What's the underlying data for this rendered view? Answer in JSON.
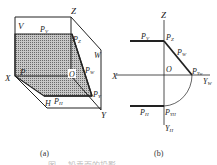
{
  "figure": {
    "panel_a": {
      "caption": "(a)",
      "labels": {
        "V": "V",
        "Z": "Z",
        "W": "W",
        "X": "X",
        "Y": "Y",
        "H": "H",
        "O": "O",
        "P": "P",
        "PV": "P",
        "PV_sub": "V",
        "PZ": "P",
        "PZ_sub": "Z",
        "PW": "P",
        "PW_sub": "W",
        "PH": "P",
        "PH_sub": "H",
        "PY": "P",
        "PY_sub": "Y"
      }
    },
    "panel_b": {
      "caption": "(b)",
      "labels": {
        "Z": "Z",
        "X": "X",
        "O": "O",
        "YW": "Y",
        "YW_sub": "W",
        "YH": "Y",
        "YH_sub": "H",
        "PV": "P",
        "PV_sub": "V",
        "PZ": "P",
        "PZ_sub": "Z",
        "PW": "P",
        "PW_sub": "W",
        "PH": "P",
        "PH_sub": "H",
        "PYW": "P",
        "PYW_sub": "Yw",
        "PYH": "P",
        "PYH_sub": "YH"
      }
    },
    "caption_faint": "图 … 铅垂面的投影"
  },
  "colors": {
    "line": "#222222",
    "shade": "#9a9a9a",
    "background": "#ffffff"
  }
}
